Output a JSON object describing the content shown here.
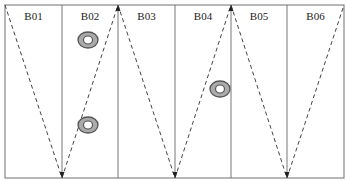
{
  "diagram": {
    "frame": {
      "x": 5,
      "y": 5,
      "width": 339,
      "height": 173,
      "stroke": "#888888"
    },
    "colors": {
      "frame": "#888888",
      "divider": "#777777",
      "dashed_path": "#444444",
      "marker_outline": "#555555",
      "marker_ring": "#aaaaaa",
      "marker_center": "#ffffff",
      "label": "#222222"
    },
    "bays": [
      {
        "id": "B01",
        "label": "B01",
        "x0": 5,
        "x1": 62
      },
      {
        "id": "B02",
        "label": "B02",
        "x0": 62,
        "x1": 118
      },
      {
        "id": "B03",
        "label": "B03",
        "x0": 118,
        "x1": 175
      },
      {
        "id": "B04",
        "label": "B04",
        "x0": 175,
        "x1": 231
      },
      {
        "id": "B05",
        "label": "B05",
        "x0": 231,
        "x1": 287
      },
      {
        "id": "B06",
        "label": "B06",
        "x0": 287,
        "x1": 344
      }
    ],
    "zigzag_path": {
      "style": "dashed",
      "points": [
        [
          5,
          5
        ],
        [
          62,
          178
        ],
        [
          118,
          5
        ],
        [
          175,
          178
        ],
        [
          231,
          5
        ],
        [
          287,
          178
        ],
        [
          344,
          5
        ]
      ],
      "arrow_vertices": [
        {
          "x": 62,
          "y": 178,
          "direction": "down"
        },
        {
          "x": 118,
          "y": 5,
          "direction": "up"
        },
        {
          "x": 175,
          "y": 178,
          "direction": "down"
        },
        {
          "x": 231,
          "y": 5,
          "direction": "up"
        },
        {
          "x": 287,
          "y": 178,
          "direction": "down"
        }
      ]
    },
    "markers": [
      {
        "bay": "B02",
        "cx": 88,
        "cy": 40,
        "rx": 10,
        "ry": 8
      },
      {
        "bay": "B02",
        "cx": 88,
        "cy": 125,
        "rx": 10,
        "ry": 8
      },
      {
        "bay": "B04",
        "cx": 220,
        "cy": 89,
        "rx": 10,
        "ry": 8
      }
    ]
  }
}
